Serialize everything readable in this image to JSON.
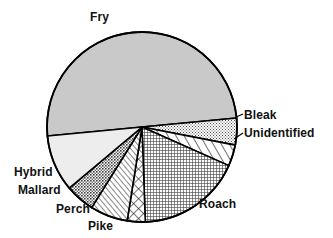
{
  "chart_data": {
    "type": "pie",
    "title": "",
    "subtitle": "",
    "xlabel": "",
    "ylabel": "",
    "legend_position": "none",
    "grid": false,
    "labels_placement": "outside-with-leader-lines",
    "categories": [
      "Fry",
      "Bleak",
      "Unidentified",
      "Roach",
      "Pike",
      "Perch",
      "Mallard",
      "Hybrid"
    ],
    "values": [
      58.0,
      4.0,
      5.0,
      21.0,
      3.0,
      5.0,
      2.0,
      2.0
    ],
    "start_angle_deg": -5.4,
    "direction": "clockwise",
    "slices": [
      {
        "label": "Fry",
        "value": 58.0,
        "start_angle_deg": 174.6,
        "end_angle_deg": 354.6,
        "sweep_deg": 208.8,
        "fill": "#c9c9c9",
        "pattern": "solid-light-gray",
        "stroke": "#000000"
      },
      {
        "label": "Bleak",
        "value": 4.0,
        "start_angle_deg": 354.6,
        "end_angle_deg": 11.0,
        "sweep_deg": 16.4,
        "fill": "#dedede",
        "pattern": "fine-stipple",
        "stroke": "#000000"
      },
      {
        "label": "Unidentified",
        "value": 5.0,
        "start_angle_deg": 11.0,
        "end_angle_deg": 24.0,
        "sweep_deg": 13.0,
        "fill": "#ffffff",
        "pattern": "diagonal-hatch",
        "stroke": "#000000"
      },
      {
        "label": "Roach",
        "value": 21.0,
        "start_angle_deg": 24.0,
        "end_angle_deg": 88.0,
        "sweep_deg": 64.0,
        "fill": "#d6d6d6",
        "pattern": "dense-crosshatch",
        "stroke": "#000000"
      },
      {
        "label": "Pike",
        "value": 3.0,
        "start_angle_deg": 88.0,
        "end_angle_deg": 99.0,
        "sweep_deg": 11.0,
        "fill": "#ffffff",
        "pattern": "open-crosshatch",
        "stroke": "#000000"
      },
      {
        "label": "Perch",
        "value": 5.0,
        "start_angle_deg": 99.0,
        "end_angle_deg": 122.0,
        "sweep_deg": 23.0,
        "fill": "#ffffff",
        "pattern": "diagonal-hatch-fine",
        "stroke": "#000000"
      },
      {
        "label": "Mallard",
        "value": 2.0,
        "start_angle_deg": 122.0,
        "end_angle_deg": 140.0,
        "sweep_deg": 18.0,
        "fill": "#b5b5b5",
        "pattern": "medium-stipple",
        "stroke": "#000000"
      },
      {
        "label": "Hybrid",
        "value": 2.0,
        "start_angle_deg": 140.0,
        "end_angle_deg": 174.6,
        "sweep_deg": 34.6,
        "fill": "#ededed",
        "pattern": "solid-very-light",
        "stroke": "#000000"
      }
    ],
    "geometry": {
      "center_x": 142,
      "center_y": 127,
      "radius": 95
    },
    "colors": {
      "outline": "#000000",
      "text": "#111111",
      "background": "#ffffff"
    }
  },
  "labels": {
    "fry": "Fry",
    "bleak": "Bleak",
    "unidentified": "Unidentified",
    "roach": "Roach",
    "pike": "Pike",
    "perch": "Perch",
    "mallard": "Mallard",
    "hybrid": "Hybrid"
  }
}
